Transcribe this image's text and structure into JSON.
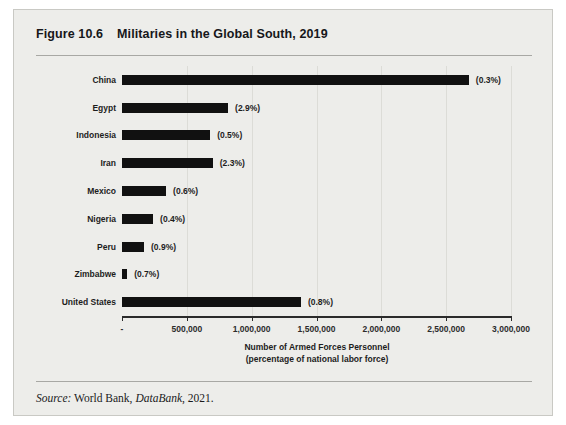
{
  "figure": {
    "number": "Figure 10.6",
    "title": "Militaries in the Global South, 2019",
    "source_prefix": "Source:",
    "source_pub": "World Bank,",
    "source_italic": "DataBank",
    "source_year": ", 2021."
  },
  "chart_data": {
    "type": "bar",
    "orientation": "horizontal",
    "title": "Militaries in the Global South, 2019",
    "xlabel": "Number of Armed Forces Personnel\n(percentage of national labor force)",
    "xlabel_line1": "Number of Armed Forces Personnel",
    "xlabel_line2": "(percentage of national labor force)",
    "ylabel": "",
    "xlim": [
      0,
      3000000
    ],
    "grid": true,
    "legend": "none",
    "tick_labels": [
      "-",
      "500,000",
      "1,000,000",
      "1,500,000",
      "2,000,000",
      "2,500,000",
      "3,000,000"
    ],
    "tick_values": [
      0,
      500000,
      1000000,
      1500000,
      2000000,
      2500000,
      3000000
    ],
    "categories": [
      "China",
      "Egypt",
      "Indonesia",
      "Iran",
      "Mexico",
      "Nigeria",
      "Peru",
      "Zimbabwe",
      "United States"
    ],
    "values": [
      2675000,
      818000,
      680000,
      700000,
      340000,
      240000,
      170000,
      40000,
      1380000
    ],
    "data_labels": [
      "(0.3%)",
      "(2.9%)",
      "(0.5%)",
      "(2.3%)",
      "(0.6%)",
      "(0.4%)",
      "(0.9%)",
      "(0.7%)",
      "(0.8%)"
    ],
    "bar_color": "#111111",
    "points": [
      {
        "category": "China",
        "value": 2675000,
        "label": "(0.3%)"
      },
      {
        "category": "Egypt",
        "value": 818000,
        "label": "(2.9%)"
      },
      {
        "category": "Indonesia",
        "value": 680000,
        "label": "(0.5%)"
      },
      {
        "category": "Iran",
        "value": 700000,
        "label": "(2.3%)"
      },
      {
        "category": "Mexico",
        "value": 340000,
        "label": "(0.6%)"
      },
      {
        "category": "Nigeria",
        "value": 240000,
        "label": "(0.4%)"
      },
      {
        "category": "Peru",
        "value": 170000,
        "label": "(0.9%)"
      },
      {
        "category": "Zimbabwe",
        "value": 40000,
        "label": "(0.7%)"
      },
      {
        "category": "United States",
        "value": 1380000,
        "label": "(0.8%)"
      }
    ]
  }
}
